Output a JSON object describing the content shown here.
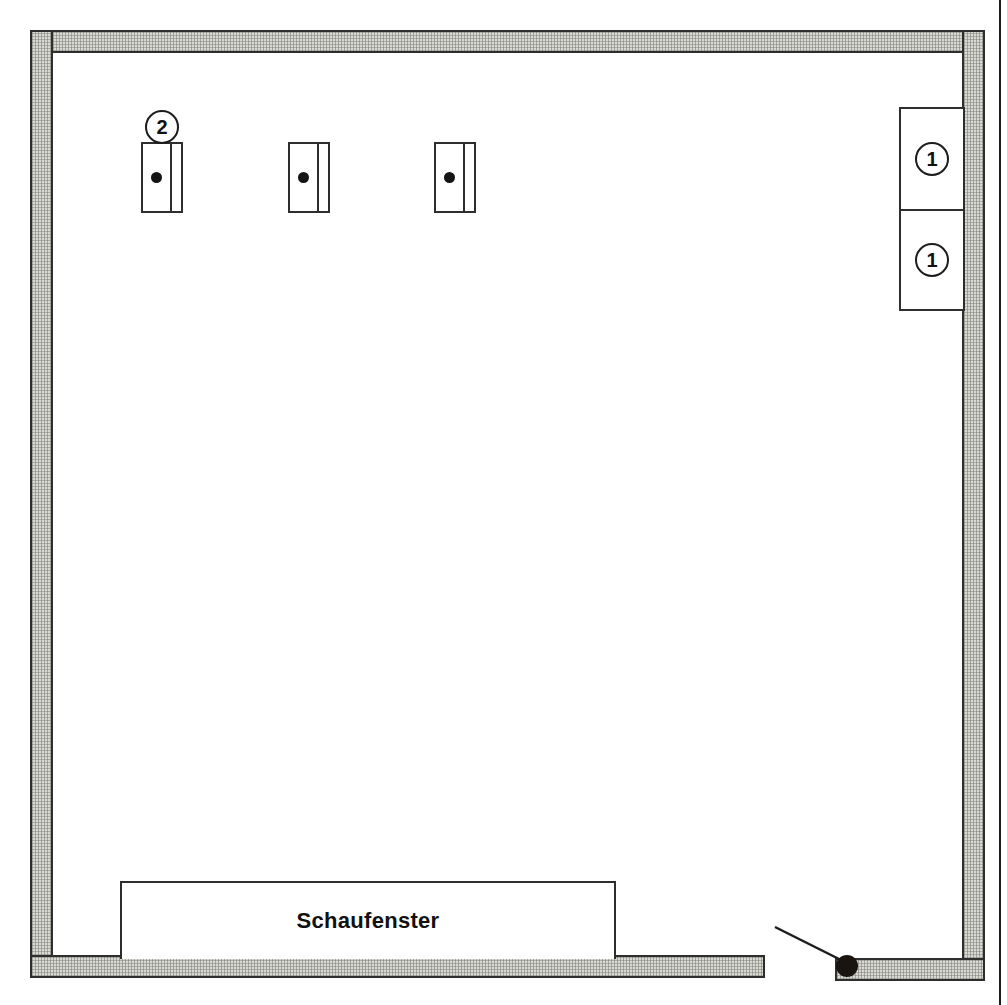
{
  "plan": {
    "title": "Schaufenster floor plan",
    "canvas": {
      "width": 1007,
      "height": 1005
    },
    "colors": {
      "wall_fill": "#d9d9d4",
      "wall_hatch": "#787873",
      "outline": "#2e2e2e",
      "ink": "#111111",
      "interior": "#ffffff",
      "marker": "#1a1410"
    }
  },
  "walls": [
    {
      "name": "top-wall",
      "x": 30,
      "y": 30,
      "w": 955,
      "h": 23
    },
    {
      "name": "left-wall",
      "x": 30,
      "y": 30,
      "w": 23,
      "h": 948
    },
    {
      "name": "right-wall",
      "x": 962,
      "y": 30,
      "w": 23,
      "h": 948
    },
    {
      "name": "bottom-wall-left",
      "x": 30,
      "y": 955,
      "w": 735,
      "h": 23
    },
    {
      "name": "bottom-wall-right",
      "x": 835,
      "y": 958,
      "w": 150,
      "h": 23
    }
  ],
  "fixtures": [
    {
      "label": "fixture-1",
      "x": 141,
      "y": 142,
      "w": 42,
      "h": 71
    },
    {
      "label": "fixture-2",
      "x": 288,
      "y": 142,
      "w": 42,
      "h": 71
    },
    {
      "label": "fixture-3",
      "x": 434,
      "y": 142,
      "w": 42,
      "h": 71
    }
  ],
  "callouts": [
    {
      "id": "callout-2",
      "number": "2",
      "x": 145,
      "y": 110
    },
    {
      "id": "callout-1-upper",
      "number": "1",
      "x": 915,
      "y": 142
    },
    {
      "id": "callout-1-lower",
      "number": "1",
      "x": 915,
      "y": 243
    }
  ],
  "side_boxes": [
    {
      "id": "side-box-upper",
      "x": 899,
      "y": 107,
      "w": 66,
      "h": 104
    },
    {
      "id": "side-box-lower",
      "x": 899,
      "y": 209,
      "w": 66,
      "h": 102
    }
  ],
  "shop_window": {
    "label": "Schaufenster",
    "x": 120,
    "y": 881,
    "w": 496,
    "h": 78
  },
  "leader": {
    "name": "leader-line",
    "x1": 775,
    "y1": 927,
    "x2": 845,
    "y2": 962
  },
  "marker_dot": {
    "name": "entry-point-marker",
    "x": 847,
    "y": 966,
    "r": 11
  }
}
